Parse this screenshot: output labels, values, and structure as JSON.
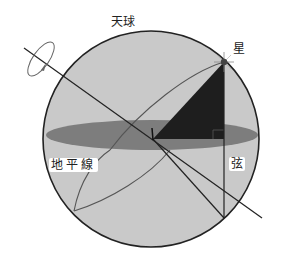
{
  "diagram": {
    "labels": {
      "celestial_sphere": "天球",
      "star": "星",
      "horizon": "地平線",
      "chord": "弦"
    },
    "colors": {
      "sphere_fill": "#c9c9c9",
      "horizon_plane": "#7d7d7d",
      "triangle": "#1e1e1e",
      "outline": "#222222",
      "orbit": "#555555",
      "background": "#ffffff"
    },
    "elements": [
      "celestial-sphere",
      "horizon-plane",
      "rotation-axis",
      "rotation-arrow",
      "star",
      "star-path-arc",
      "altitude-triangle",
      "chord-line",
      "observer"
    ]
  }
}
